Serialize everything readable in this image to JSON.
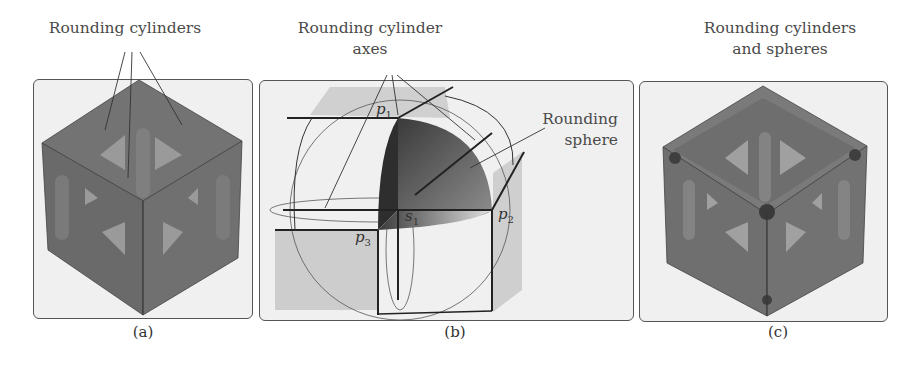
{
  "figure": {
    "panels": [
      {
        "id": "a",
        "caption": "(a)",
        "annotation": {
          "lines": [
            "Rounding cylinders"
          ]
        },
        "description": "Rounded cube lattice with rounding cylinders along edges"
      },
      {
        "id": "b",
        "caption": "(b)",
        "annotation_top": {
          "lines": [
            "Rounding cylinder",
            "axes"
          ]
        },
        "annotation_right": {
          "lines": [
            "Rounding",
            "sphere"
          ]
        },
        "points": {
          "p1": {
            "base": "p",
            "index": "1"
          },
          "p2": {
            "base": "p",
            "index": "2"
          },
          "p3": {
            "base": "p",
            "index": "3"
          },
          "s1": {
            "base": "s",
            "index": "1"
          }
        }
      },
      {
        "id": "c",
        "caption": "(c)",
        "annotation": {
          "lines": [
            "Rounding cylinders",
            "and spheres"
          ]
        },
        "description": "Rounded cube lattice with rounding cylinders and corner spheres"
      }
    ]
  },
  "colors": {
    "panel_bg": "#f0f0f0",
    "cube_dark": "#6b6b6b",
    "cube_mid": "#7a7a7a",
    "cube_light": "#8c8c8c",
    "window": "#a8a8a8",
    "sphere_dark": "#3a3a3a",
    "shadow_gray": "#cfcfcf"
  }
}
